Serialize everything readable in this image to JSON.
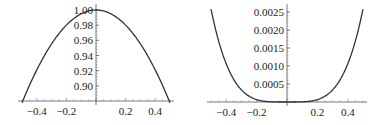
{
  "chart_data": [
    {
      "type": "line",
      "title": "",
      "xlabel": "",
      "ylabel": "",
      "function_hint": "cos(x)",
      "xlim": [
        -0.5,
        0.5
      ],
      "ylim": [
        0.88,
        1.0
      ],
      "axes_origin": [
        0,
        0.88
      ],
      "x_ticks": [
        "-0.4",
        "-0.2",
        "0.2",
        "0.4"
      ],
      "y_ticks": [
        "0.90",
        "0.92",
        "0.94",
        "0.96",
        "0.98",
        "1.00"
      ],
      "grid": false,
      "x": [
        -0.5,
        -0.4,
        -0.3,
        -0.2,
        -0.1,
        0,
        0.1,
        0.2,
        0.3,
        0.4,
        0.5
      ],
      "values": [
        0.8776,
        0.9211,
        0.9553,
        0.9801,
        0.995,
        1.0,
        0.995,
        0.9801,
        0.9553,
        0.9211,
        0.8776
      ],
      "color": "#333333"
    },
    {
      "type": "line",
      "title": "",
      "xlabel": "",
      "ylabel": "",
      "function_hint": "cos(x) - 1 + x^2/2 (≈ x^4/24)",
      "xlim": [
        -0.5,
        0.5
      ],
      "ylim": [
        0,
        0.0026
      ],
      "axes_origin": [
        0,
        0
      ],
      "x_ticks": [
        "-0.4",
        "-0.2",
        "0.2",
        "0.4"
      ],
      "y_ticks": [
        "0.0005",
        "0.0010",
        "0.0015",
        "0.0020",
        "0.0025"
      ],
      "grid": false,
      "x": [
        -0.5,
        -0.4,
        -0.3,
        -0.2,
        -0.1,
        0,
        0.1,
        0.2,
        0.3,
        0.4,
        0.5
      ],
      "values": [
        0.00259,
        0.00106,
        0.000337,
        6.66e-05,
        4.2e-06,
        0,
        4.2e-06,
        6.66e-05,
        0.000337,
        0.00106,
        0.00259
      ],
      "color": "#333333"
    }
  ]
}
